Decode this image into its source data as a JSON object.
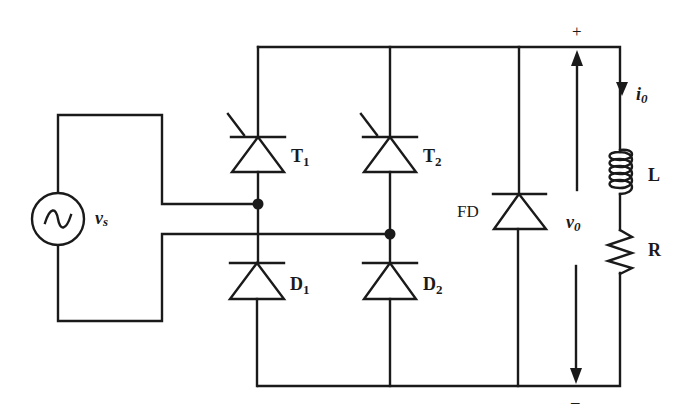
{
  "diagram": {
    "type": "circuit",
    "source": {
      "label": "v",
      "subscript": "s",
      "icon": "ac-source-icon"
    },
    "thyristors": [
      {
        "label": "T",
        "subscript": "1"
      },
      {
        "label": "T",
        "subscript": "2"
      }
    ],
    "diodes": [
      {
        "label": "D",
        "subscript": "1"
      },
      {
        "label": "D",
        "subscript": "2"
      }
    ],
    "freewheeling_diode": {
      "label": "FD"
    },
    "output_voltage": {
      "label": "v",
      "subscript": "0",
      "plus": "+",
      "minus": "–"
    },
    "output_current": {
      "label": "i",
      "subscript": "0"
    },
    "inductor": {
      "label": "L"
    },
    "resistor": {
      "label": "R"
    },
    "colors": {
      "line": "#1a1a1a",
      "background": "#ffffff"
    }
  }
}
